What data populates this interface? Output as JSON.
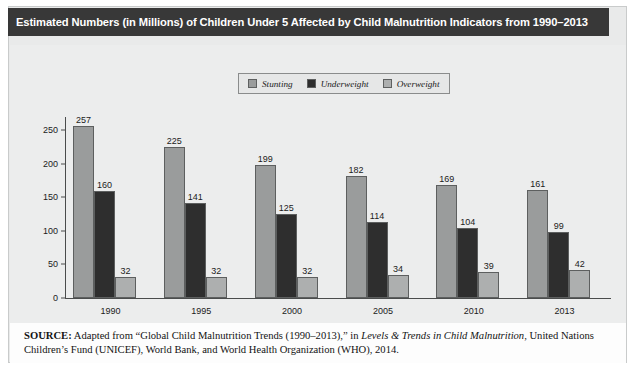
{
  "figure": {
    "title": "Estimated Numbers (in Millions) of Children Under 5 Affected by Child Malnutrition Indicators from 1990–2013",
    "source_lead": "SOURCE:",
    "source_part1": " Adapted from “Global Child Malnutrition Trends (1990–2013),” in ",
    "source_italic": "Levels & Trends in Child Malnutrition",
    "source_part2": ", United Nations Children’s Fund (UNICEF), World Bank, and World Health Organization (WHO), 2014."
  },
  "colors": {
    "title_bar": "#383838",
    "panel_bg": "#eceded",
    "stunting": "#9a9c9c",
    "underweight": "#2e2e2e",
    "overweight": "#adafaf",
    "axis": "#4a4c4c",
    "source_bg": "#fdfdfd"
  },
  "chart_data": {
    "type": "bar",
    "title": "Estimated Numbers (in Millions) of Children Under 5 Affected by Child Malnutrition Indicators from 1990–2013",
    "xlabel": "",
    "ylabel": "",
    "categories": [
      "1990",
      "1995",
      "2000",
      "2005",
      "2010",
      "2013"
    ],
    "series": [
      {
        "name": "Stunting",
        "color": "#9a9c9c",
        "values": [
          257,
          225,
          199,
          182,
          169,
          161
        ]
      },
      {
        "name": "Underweight",
        "color": "#2e2e2e",
        "values": [
          160,
          141,
          125,
          114,
          104,
          99
        ]
      },
      {
        "name": "Overweight",
        "color": "#adafaf",
        "values": [
          32,
          32,
          32,
          34,
          39,
          42
        ]
      }
    ],
    "ylim": [
      0,
      270
    ],
    "yticks": [
      0,
      50,
      100,
      150,
      200,
      250
    ],
    "grid": false,
    "legend_position": "top-center",
    "value_labels": true
  }
}
